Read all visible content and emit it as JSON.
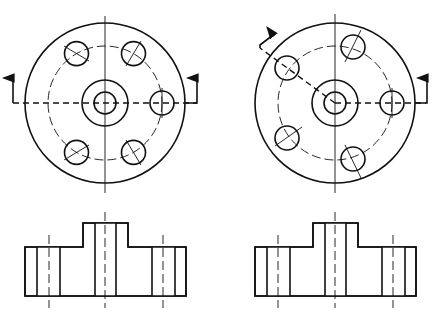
{
  "figure": {
    "stroke_color": "#111111",
    "background": "#ffffff",
    "views": [
      {
        "id": "left",
        "name": "Full section (straight cut)",
        "top_view": {
          "center": [
            105,
            103
          ],
          "outer_r": 80,
          "bolt_circle_r": 57,
          "hub_r": 23,
          "bore_r": 11,
          "hole_r": 12,
          "hole_angles_deg": [
            0,
            60,
            120,
            240,
            300
          ],
          "cut": "straight horizontal"
        },
        "section": {
          "base": [
            25,
            247,
            186,
            296
          ],
          "boss": [
            83,
            223,
            128,
            247
          ]
        }
      },
      {
        "id": "right",
        "name": "Aligned section (bent cut)",
        "top_view": {
          "center": [
            335,
            103
          ],
          "outer_r": 80,
          "bolt_circle_r": 57,
          "hub_r": 23,
          "bore_r": 11,
          "hole_r": 12,
          "hole_angles_deg": [
            0,
            60,
            120,
            240,
            300
          ],
          "cut": "bent: through hole at 150deg and hole at 0deg"
        },
        "section": {
          "base": [
            255,
            247,
            416,
            296
          ],
          "boss": [
            313,
            223,
            358,
            247
          ]
        }
      }
    ]
  }
}
